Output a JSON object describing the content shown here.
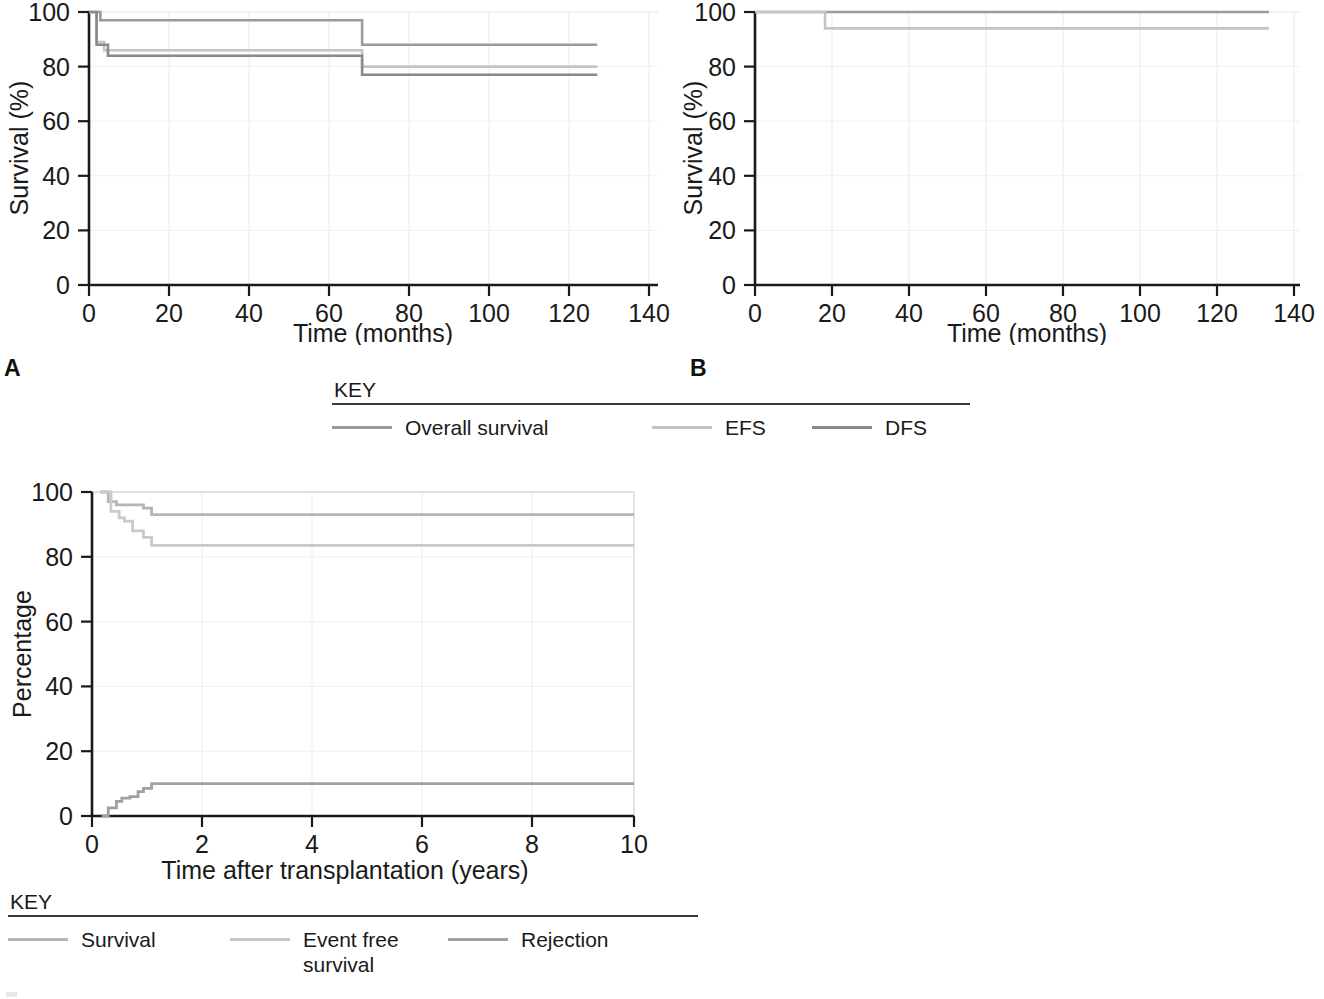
{
  "figure": {
    "panel_a_letter": "A",
    "panel_b_letter": "B"
  },
  "key_top": {
    "title": "KEY",
    "items": [
      {
        "label": "Overall survival",
        "color": "#9a9a9a"
      },
      {
        "label": "EFS",
        "color": "#c4c4c4"
      },
      {
        "label": "DFS",
        "color": "#8a8a8a"
      }
    ]
  },
  "key_bottom": {
    "title": "KEY",
    "items": [
      {
        "label": "Survival",
        "color": "#b5b5b5"
      },
      {
        "label": "Event free\nsurvival",
        "color": "#c9c9c9"
      },
      {
        "label": "Rejection",
        "color": "#a0a0a0"
      }
    ]
  },
  "chart_data": [
    {
      "id": "panel_a",
      "type": "line",
      "title": "",
      "xlabel": "Time (months)",
      "ylabel": "Survival (%)",
      "xlim": [
        0,
        150
      ],
      "ylim": [
        0,
        100
      ],
      "xticks": [
        0,
        20,
        40,
        60,
        80,
        100,
        120,
        140
      ],
      "yticks": [
        0,
        20,
        40,
        60,
        80,
        100
      ],
      "grid": true,
      "legend": "KEY",
      "legend_position": "below-figure",
      "step": true,
      "series": [
        {
          "name": "Overall survival",
          "color": "#9a9a9a",
          "x": [
            0,
            2,
            3,
            72,
            72,
            134
          ],
          "y": [
            100,
            100,
            97,
            97,
            88,
            88
          ]
        },
        {
          "name": "EFS",
          "color": "#c4c4c4",
          "x": [
            0,
            2,
            2,
            4,
            4,
            72,
            72,
            134
          ],
          "y": [
            100,
            100,
            89,
            89,
            86,
            86,
            80,
            80
          ]
        },
        {
          "name": "DFS",
          "color": "#8a8a8a",
          "x": [
            0,
            2,
            2,
            5,
            5,
            72,
            72,
            134
          ],
          "y": [
            100,
            100,
            88,
            88,
            84,
            84,
            77,
            77
          ]
        }
      ]
    },
    {
      "id": "panel_b",
      "type": "line",
      "title": "",
      "xlabel": "Time (months)",
      "ylabel": "Survival (%)",
      "xlim": [
        0,
        140
      ],
      "ylim": [
        0,
        100
      ],
      "xticks": [
        0,
        20,
        40,
        60,
        80,
        100,
        120,
        140
      ],
      "yticks": [
        0,
        20,
        40,
        60,
        80,
        100
      ],
      "grid": true,
      "legend": "KEY",
      "legend_position": "below-figure",
      "step": true,
      "series": [
        {
          "name": "Overall survival",
          "color": "#9a9a9a",
          "x": [
            0,
            132
          ],
          "y": [
            100,
            100
          ]
        },
        {
          "name": "EFS",
          "color": "#c4c4c4",
          "x": [
            0,
            18,
            18,
            132
          ],
          "y": [
            100,
            100,
            94,
            94
          ]
        }
      ]
    },
    {
      "id": "panel_c",
      "type": "line",
      "title": "",
      "xlabel": "Time after transplantation (years)",
      "ylabel": "Percentage",
      "xlim": [
        0,
        10
      ],
      "ylim": [
        0,
        100
      ],
      "xticks": [
        0,
        2,
        4,
        6,
        8,
        10
      ],
      "yticks": [
        0,
        20,
        40,
        60,
        80,
        100
      ],
      "grid": true,
      "legend": "KEY",
      "legend_position": "below-figure",
      "step": true,
      "series": [
        {
          "name": "Survival",
          "color": "#b5b5b5",
          "x": [
            0.15,
            0.3,
            0.45,
            0.6,
            0.95,
            1.05,
            1.1,
            10
          ],
          "y": [
            100,
            97,
            96,
            96,
            95,
            95,
            93,
            93
          ]
        },
        {
          "name": "Event free survival",
          "color": "#c9c9c9",
          "x": [
            0.15,
            0.35,
            0.5,
            0.6,
            0.75,
            0.95,
            1.1,
            10
          ],
          "y": [
            100,
            94,
            92,
            91,
            88,
            86,
            83.5,
            83.5
          ]
        },
        {
          "name": "Rejection",
          "color": "#a0a0a0",
          "x": [
            0.18,
            0.3,
            0.45,
            0.55,
            0.7,
            0.85,
            0.95,
            1.1,
            10
          ],
          "y": [
            0,
            2.5,
            4.5,
            5.5,
            6,
            7.5,
            8.5,
            10,
            10
          ]
        }
      ]
    }
  ]
}
